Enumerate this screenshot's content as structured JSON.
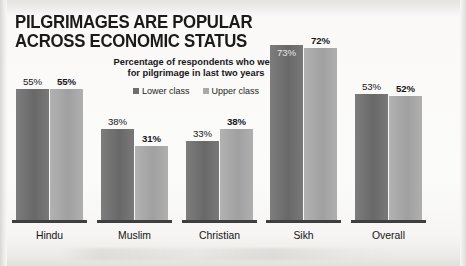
{
  "title": {
    "line1": "PILGRIMAGES ARE POPULAR",
    "line2": "ACROSS ECONOMIC STATUS"
  },
  "subtitle": {
    "line1": "Percentage of respondents who went",
    "line2": "for pilgrimage in last two years"
  },
  "legend": [
    {
      "label": "Lower class",
      "color": "#6e6e6e"
    },
    {
      "label": "Upper class",
      "color": "#a9a9a9"
    }
  ],
  "chart_data": {
    "type": "bar",
    "title": "PILGRIMAGES ARE POPULAR ACROSS ECONOMIC STATUS",
    "subtitle": "Percentage of respondents who went for pilgrimage in last two years",
    "xlabel": "",
    "ylabel": "",
    "ylim": [
      0,
      80
    ],
    "grid": false,
    "legend_position": "top-center",
    "unit": "%",
    "categories": [
      "Hindu",
      "Muslim",
      "Christian",
      "Sikh",
      "Overall"
    ],
    "series": [
      {
        "name": "Lower class",
        "color": "#6e6e6e",
        "values": [
          55,
          38,
          33,
          73,
          53
        ]
      },
      {
        "name": "Upper class",
        "color": "#a9a9a9",
        "values": [
          55,
          31,
          38,
          72,
          52
        ]
      }
    ],
    "labels": [
      {
        "category": "Hindu",
        "series": "Lower class",
        "text": "55%",
        "bold": false,
        "placement": "above"
      },
      {
        "category": "Hindu",
        "series": "Upper class",
        "text": "55%",
        "bold": true,
        "placement": "above"
      },
      {
        "category": "Muslim",
        "series": "Lower class",
        "text": "38%",
        "bold": false,
        "placement": "above"
      },
      {
        "category": "Muslim",
        "series": "Upper class",
        "text": "31%",
        "bold": true,
        "placement": "above"
      },
      {
        "category": "Christian",
        "series": "Lower class",
        "text": "33%",
        "bold": false,
        "placement": "above"
      },
      {
        "category": "Christian",
        "series": "Upper class",
        "text": "38%",
        "bold": true,
        "placement": "above"
      },
      {
        "category": "Sikh",
        "series": "Lower class",
        "text": "73%",
        "bold": false,
        "placement": "inside"
      },
      {
        "category": "Sikh",
        "series": "Upper class",
        "text": "72%",
        "bold": true,
        "placement": "above"
      },
      {
        "category": "Overall",
        "series": "Lower class",
        "text": "53%",
        "bold": false,
        "placement": "above"
      },
      {
        "category": "Overall",
        "series": "Upper class",
        "text": "52%",
        "bold": true,
        "placement": "above"
      }
    ]
  },
  "groups": [
    {
      "name": "Hindu",
      "left": 16,
      "barw": 33,
      "gap": 1,
      "width": 67,
      "dark": {
        "h": 131,
        "label": "55%",
        "bold": false,
        "inside": false
      },
      "light": {
        "h": 131,
        "label": "55%",
        "bold": true,
        "inside": false
      }
    },
    {
      "name": "Muslim",
      "left": 101,
      "barw": 33,
      "gap": 1,
      "width": 67,
      "dark": {
        "h": 91,
        "label": "38%",
        "bold": false,
        "inside": false
      },
      "light": {
        "h": 74,
        "label": "31%",
        "bold": true,
        "inside": false
      }
    },
    {
      "name": "Christian",
      "left": 186,
      "barw": 33,
      "gap": 1,
      "width": 67,
      "dark": {
        "h": 79,
        "label": "33%",
        "bold": false,
        "inside": false
      },
      "light": {
        "h": 91,
        "label": "38%",
        "bold": true,
        "inside": false
      }
    },
    {
      "name": "Sikh",
      "left": 270,
      "barw": 33,
      "gap": 1,
      "width": 67,
      "dark": {
        "h": 175,
        "label": "73%",
        "bold": false,
        "inside": true
      },
      "light": {
        "h": 172,
        "label": "72%",
        "bold": true,
        "inside": false
      }
    },
    {
      "name": "Overall",
      "left": 355,
      "barw": 33,
      "gap": 1,
      "width": 67,
      "dark": {
        "h": 126,
        "label": "53%",
        "bold": false,
        "inside": false
      },
      "light": {
        "h": 124,
        "label": "52%",
        "bold": true,
        "inside": false
      }
    }
  ]
}
